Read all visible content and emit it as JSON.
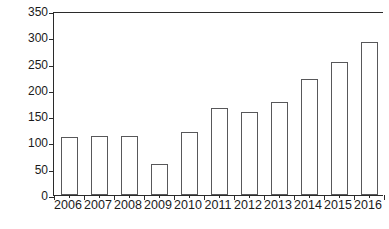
{
  "chart_data": {
    "type": "bar",
    "title": "",
    "subtitle": "",
    "xlabel": "",
    "ylabel": "Thousands of Units",
    "categories": [
      "2006",
      "2007",
      "2008",
      "2009",
      "2010",
      "2011",
      "2012",
      "2013",
      "2014",
      "2015",
      "2016"
    ],
    "values": [
      111,
      113,
      112,
      59,
      120,
      165,
      157,
      177,
      220,
      253,
      292
    ],
    "series": [
      {
        "name": "Units",
        "values": [
          111,
          113,
          112,
          59,
          120,
          165,
          157,
          177,
          220,
          253,
          292
        ]
      }
    ],
    "ylim": [
      0,
      350
    ],
    "yticks": [
      0,
      50,
      100,
      150,
      200,
      250,
      300,
      350
    ],
    "ytick_labels": [
      "0",
      "50",
      "100",
      "150",
      "200",
      "250",
      "300",
      "350"
    ],
    "grid": false,
    "legend": false,
    "legend_position": "none",
    "annotations": [],
    "colors": {
      "bar_fill": "#ffffff",
      "bar_stroke": "#58585a",
      "axis": "#2b2b2b",
      "text": "#1a1a1a",
      "background": "#ffffff"
    }
  }
}
